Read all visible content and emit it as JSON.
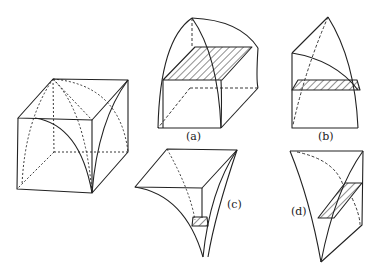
{
  "figure": {
    "stroke_color": "#222222",
    "background": "#ffffff",
    "parts": [
      {
        "id": "cube",
        "label": ""
      },
      {
        "id": "a",
        "label": "(a)"
      },
      {
        "id": "b",
        "label": "(b)"
      },
      {
        "id": "c",
        "label": "(c)"
      },
      {
        "id": "d",
        "label": "(d)"
      }
    ]
  }
}
